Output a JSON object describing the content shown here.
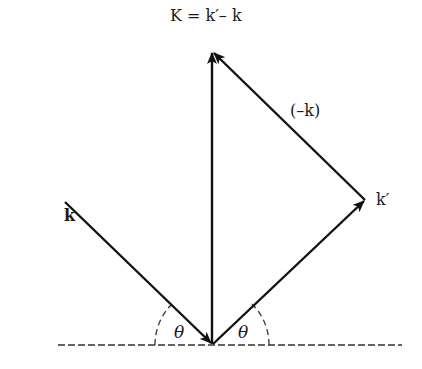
{
  "diagram": {
    "title_equation": "K = k′– k",
    "labels": {
      "incident": "k",
      "scattered": "k′",
      "negative_k": "(–k)",
      "angle_left": "θ",
      "angle_right": "θ"
    },
    "colors": {
      "line": "#111111",
      "background": "#ffffff"
    }
  }
}
